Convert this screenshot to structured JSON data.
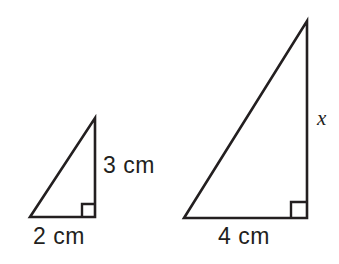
{
  "figure": {
    "kind": "similar-right-triangles-diagram",
    "background_color": "#ffffff",
    "stroke_color": "#231f20",
    "text_color": "#231f20",
    "stroke_width": 2.6,
    "canvas": {
      "width": 339,
      "height": 264
    },
    "triangles": [
      {
        "name": "small-triangle",
        "vertices": {
          "bottom_left": [
            30,
            217
          ],
          "bottom_right": [
            95,
            217
          ],
          "apex": [
            95,
            118
          ]
        },
        "base_length_px": 65,
        "height_px": 99,
        "right_angle_vertex": "bottom_right",
        "right_angle_marker_size_px": 13,
        "labels": {
          "vertical_leg": "3 cm",
          "base": "2 cm"
        }
      },
      {
        "name": "large-triangle",
        "vertices": {
          "bottom_left": [
            184,
            218
          ],
          "bottom_right": [
            307,
            218
          ],
          "apex": [
            307,
            21
          ]
        },
        "base_length_px": 123,
        "height_px": 197,
        "right_angle_vertex": "bottom_right",
        "right_angle_marker_size_px": 16,
        "labels": {
          "vertical_leg": "x",
          "base": "4 cm"
        }
      }
    ]
  },
  "labels": {
    "small_triangle_leg": "3 cm",
    "small_triangle_base": "2 cm",
    "large_triangle_leg": "x",
    "large_triangle_base": "4 cm"
  }
}
